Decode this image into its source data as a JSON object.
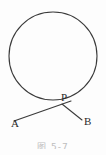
{
  "figure": {
    "type": "geometry-diagram",
    "background_color": "#fdfdfd",
    "stroke_color": "#3a3a3a",
    "label_color": "#2b2b2b",
    "caption": "图 5-7",
    "caption_color": "#8a8a8a",
    "width": 106,
    "height": 155
  },
  "labels": {
    "point_a": "A",
    "point_b": "B",
    "point_p": "P"
  },
  "chart_data": {
    "type": "scatter",
    "title": "图 5-7",
    "xlabel": "",
    "ylabel": "",
    "xlim": [
      0,
      106
    ],
    "ylim": [
      0,
      155
    ],
    "grid": false,
    "legend": "none",
    "shapes": [
      {
        "name": "circle",
        "kind": "circle",
        "cx": 53,
        "cy": 56,
        "r": 44,
        "stroke": "#3a3a3a",
        "stroke_width": 1.1,
        "fill": "none"
      },
      {
        "name": "segment-AP",
        "kind": "line",
        "x1": 14,
        "y1": 121,
        "x2": 71,
        "y2": 101,
        "stroke": "#3a3a3a",
        "stroke_width": 1.1
      },
      {
        "name": "segment-PB",
        "kind": "line",
        "x1": 62,
        "y1": 104,
        "x2": 82,
        "y2": 120,
        "stroke": "#3a3a3a",
        "stroke_width": 1.1
      }
    ],
    "points": [
      {
        "name": "A",
        "label": "A",
        "x": 14,
        "y": 121,
        "label_x": 11,
        "label_y": 118
      },
      {
        "name": "B",
        "label": "B",
        "x": 82,
        "y": 120,
        "label_x": 84,
        "label_y": 116
      },
      {
        "name": "P",
        "label": "P",
        "x": 62,
        "y": 104,
        "label_x": 61,
        "label_y": 92
      }
    ]
  }
}
